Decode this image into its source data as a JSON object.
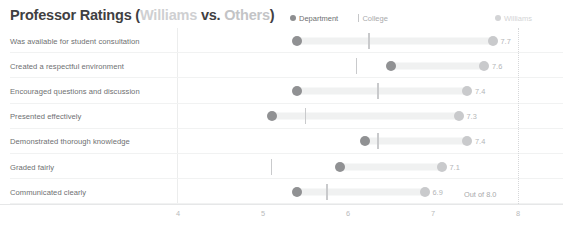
{
  "title": {
    "prefix": "Professor Ratings (",
    "highlight_a": "Williams",
    "middle": " vs. ",
    "highlight_b": "Others",
    "suffix": ")"
  },
  "legend": {
    "department": "Department",
    "college": "College",
    "williams": "Williams"
  },
  "annotation": {
    "max_note": "Out of 8.0"
  },
  "colors": {
    "department": "#909193",
    "college": "#c9cacc",
    "williams": "#c9cacc",
    "band": "#f0f1f1",
    "title_dark": "#3f4042",
    "title_light": "#cfd0d2",
    "axis": "#e6e7e8"
  },
  "chart_data": {
    "type": "bar",
    "title": "Professor Ratings (Williams vs. Others)",
    "subtitle": "",
    "xlabel": "",
    "ylabel": "",
    "xlim": [
      3.65,
      8.2
    ],
    "xticks": [
      4,
      5,
      6,
      7,
      8
    ],
    "xticklabels": [
      "4",
      "5",
      "6",
      "7",
      "8"
    ],
    "grid": false,
    "legend_position": "top-right",
    "max_scale": 8.0,
    "annotations": [
      "Out of 8.0"
    ],
    "categories": [
      "Was available for student consultation",
      "Created a respectful environment",
      "Encouraged questions and discussion",
      "Presented effectively",
      "Demonstrated thorough knowledge",
      "Graded fairly",
      "Communicated clearly"
    ],
    "series": [
      {
        "name": "Department",
        "values": [
          5.4,
          6.5,
          5.4,
          5.1,
          6.2,
          5.9,
          5.4
        ]
      },
      {
        "name": "College",
        "values": [
          6.25,
          6.1,
          6.35,
          5.5,
          6.35,
          5.1,
          5.75
        ]
      },
      {
        "name": "Williams",
        "values": [
          7.7,
          7.6,
          7.4,
          7.3,
          7.4,
          7.1,
          6.9
        ]
      }
    ],
    "value_labels": [
      "7.7",
      "7.6",
      "7.4",
      "7.3",
      "7.4",
      "7.1",
      "6.9"
    ]
  }
}
